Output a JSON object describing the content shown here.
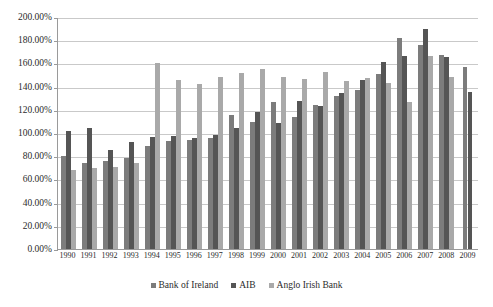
{
  "chart_data": {
    "type": "bar",
    "title": "",
    "xlabel": "",
    "ylabel": "",
    "ylim": [
      0,
      200
    ],
    "ytick_step": 20,
    "ytick_labels": [
      "0.00%",
      "20.00%",
      "40.00%",
      "60.00%",
      "80.00%",
      "100.00%",
      "120.00%",
      "140.00%",
      "160.00%",
      "180.00%",
      "200.00%"
    ],
    "grid": true,
    "legend_position": "bottom",
    "categories": [
      "1990",
      "1991",
      "1992",
      "1993",
      "1994",
      "1995",
      "1996",
      "1997",
      "1998",
      "1999",
      "2000",
      "2001",
      "2002",
      "2003",
      "2004",
      "2005",
      "2006",
      "2007",
      "2008",
      "2009"
    ],
    "series": [
      {
        "name": "Bank of Ireland",
        "color": "#7c7c7c",
        "values": [
          80.5,
          74.5,
          75.5,
          78.5,
          88.5,
          93.0,
          94.0,
          95.5,
          115.5,
          109.5,
          126.5,
          114.0,
          124.5,
          131.5,
          137.0,
          151.0,
          181.5,
          175.5,
          167.0,
          157.0
        ]
      },
      {
        "name": "AIB",
        "color": "#555555",
        "values": [
          102.0,
          104.5,
          85.0,
          92.0,
          96.5,
          97.5,
          96.0,
          98.5,
          104.5,
          118.5,
          108.5,
          128.0,
          123.0,
          134.5,
          145.5,
          161.0,
          166.5,
          189.5,
          165.5,
          135.0
        ]
      },
      {
        "name": "Anglo Irish Bank",
        "color": "#a9a9a9",
        "values": [
          68.0,
          69.5,
          71.0,
          74.0,
          160.0,
          146.0,
          142.0,
          148.5,
          152.0,
          155.0,
          148.5,
          146.5,
          152.5,
          144.5,
          147.5,
          143.5,
          126.5,
          166.5,
          148.0,
          null
        ]
      }
    ],
    "legend_entries": [
      "Bank of Ireland",
      "AIB",
      "Anglo Irish Bank"
    ]
  }
}
